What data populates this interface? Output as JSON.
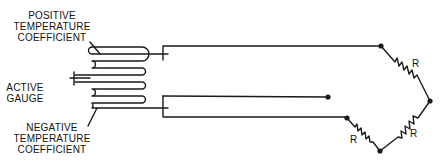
{
  "labels": {
    "positive": [
      "POSITIVE",
      "TEMPERATURE",
      "COEFFICIENT"
    ],
    "active": [
      "ACTIVE",
      "GAUGE"
    ],
    "negative": [
      "NEGATIVE",
      "TEMPERATURE",
      "COEFFICIENT"
    ]
  },
  "resistors": {
    "top_right": "R",
    "bottom_right": "R",
    "bottom_left": "R"
  },
  "colors": {
    "stroke": "#1a1a1a",
    "background": "#ffffff"
  }
}
